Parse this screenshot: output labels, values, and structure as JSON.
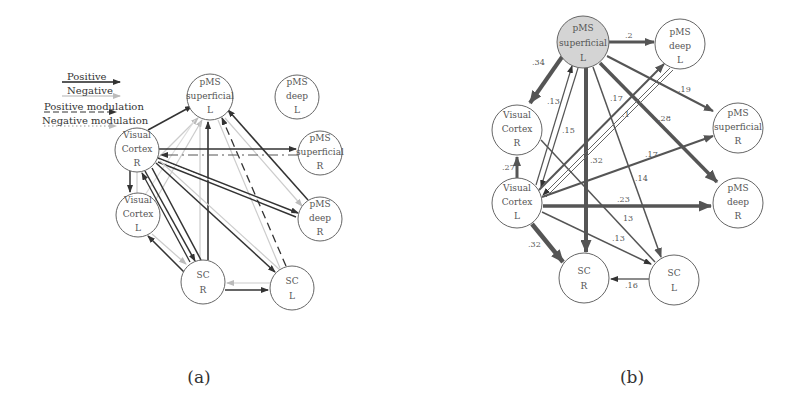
{
  "panel_a": {
    "caption": "(a)",
    "legend": [
      {
        "label": "Positive",
        "style": "solid-dark"
      },
      {
        "label": "Negative",
        "style": "solid-light"
      },
      {
        "label": "Positive modulation",
        "style": "dashed-dark"
      },
      {
        "label": "Negative modulation",
        "style": "dotted-dark"
      }
    ],
    "nodes": {
      "pms_sup_l": {
        "line1": "pMS",
        "line2": "superficial",
        "line3": "L"
      },
      "pms_deep_l": {
        "line1": "pMS",
        "line2": "deep",
        "line3": "L"
      },
      "vc_r": {
        "line1": "Visual",
        "line2": "Cortex",
        "line3": "R"
      },
      "pms_sup_r": {
        "line1": "pMS",
        "line2": "superficial",
        "line3": "R"
      },
      "vc_l": {
        "line1": "Visual",
        "line2": "Cortex",
        "line3": "L"
      },
      "pms_deep_r": {
        "line1": "pMS",
        "line2": "deep",
        "line3": "R"
      },
      "sc_r": {
        "line1": "SC",
        "line2": "R"
      },
      "sc_l": {
        "line1": "SC",
        "line2": "L"
      }
    }
  },
  "panel_b": {
    "caption": "(b)",
    "highlight_color": "#d4d4d4",
    "nodes": {
      "pms_sup_l": {
        "line1": "pMS",
        "line2": "superficial",
        "line3": "L"
      },
      "pms_deep_l": {
        "line1": "pMS",
        "line2": "deep",
        "line3": "L"
      },
      "vc_r": {
        "line1": "Visual",
        "line2": "Cortex",
        "line3": "R"
      },
      "pms_sup_r": {
        "line1": "pMS",
        "line2": "superficial",
        "line3": "R"
      },
      "vc_l": {
        "line1": "Visual",
        "line2": "Cortex",
        "line3": "L"
      },
      "pms_deep_r": {
        "line1": "pMS",
        "line2": "deep",
        "line3": "R"
      },
      "sc_r": {
        "line1": "SC",
        "line2": "R"
      },
      "sc_l": {
        "line1": "SC",
        "line2": "L"
      }
    },
    "edges": [
      {
        "from": "pMS superficial L",
        "to": "pMS deep L",
        "weight": ".2"
      },
      {
        "from": "pMS superficial L",
        "to": "Visual Cortex R",
        "weight": ".34"
      },
      {
        "from": "pMS superficial L",
        "to": "pMS superficial R",
        "weight": ".19"
      },
      {
        "from": "pMS superficial L",
        "to": "pMS deep R",
        "weight": ".28"
      },
      {
        "from": "pMS superficial L",
        "to": "SC R",
        "weight": ".32"
      },
      {
        "from": "pMS superficial L",
        "to": "SC L",
        "weight": ".14"
      },
      {
        "from": "pMS superficial L",
        "to": "Visual Cortex L",
        "weight": ".15"
      },
      {
        "from": "Visual Cortex L",
        "to": "pMS superficial L",
        "weight": ".13"
      },
      {
        "from": "Visual Cortex L",
        "to": "pMS deep L",
        "weight": ".17"
      },
      {
        "from": "pMS deep L",
        "to": "Visual Cortex L",
        "weight": ".1"
      },
      {
        "from": "Visual Cortex L",
        "to": "Visual Cortex R",
        "weight": ".27"
      },
      {
        "from": "Visual Cortex L",
        "to": "pMS superficial R",
        "weight": ".17"
      },
      {
        "from": "Visual Cortex L",
        "to": "pMS deep R",
        "weight": ".23"
      },
      {
        "from": "Visual Cortex L",
        "to": "SC R",
        "weight": ".32"
      },
      {
        "from": "Visual Cortex L",
        "to": "SC L",
        "weight": ".13"
      },
      {
        "from": "Visual Cortex R",
        "to": "SC L",
        "weight": ".13"
      },
      {
        "from": "SC L",
        "to": "SC R",
        "weight": ".16"
      }
    ],
    "labels": {
      "w_2": ".2",
      "w_34": ".34",
      "w_19": ".19",
      "w_28": ".28",
      "w_13a": ".13",
      "w_15": ".15",
      "w_17a": ".17",
      "w_1": ".1",
      "w_32a": ".32",
      "w_14": ".14",
      "w_17b": ".17",
      "w_27": ".27",
      "w_23": ".23",
      "w_13b": "13",
      "w_13c": ".13",
      "w_32b": ".32",
      "w_16": ".16"
    }
  }
}
